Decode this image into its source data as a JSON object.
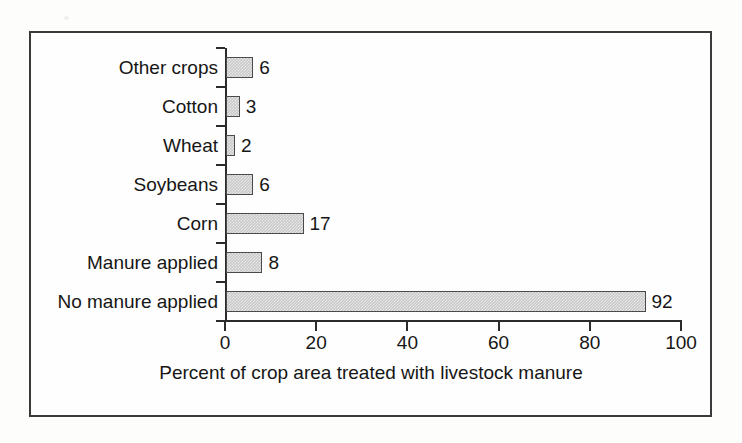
{
  "figure": {
    "frame_color": "#3a3a3a",
    "background_color": "#fdfdfc"
  },
  "chart_data": {
    "type": "bar",
    "orientation": "horizontal",
    "title": "",
    "xlabel": "Percent of crop area treated with livestock manure",
    "ylabel": "",
    "xlim": [
      0,
      100
    ],
    "xticks": [
      0,
      20,
      40,
      60,
      80,
      100
    ],
    "xtick_labels": [
      "0",
      "20",
      "40",
      "60",
      "80",
      "100"
    ],
    "grid": false,
    "legend": null,
    "bar_fill_color": "#c9c9c9",
    "bar_edge_color": "#4a4a4a",
    "categories": [
      "Other crops",
      "Cotton",
      "Wheat",
      "Soybeans",
      "Corn",
      "Manure applied",
      "No manure applied"
    ],
    "values": [
      6,
      3,
      2,
      6,
      17,
      8,
      92
    ],
    "value_labels": [
      "6",
      "3",
      "2",
      "6",
      "17",
      "8",
      "92"
    ]
  }
}
